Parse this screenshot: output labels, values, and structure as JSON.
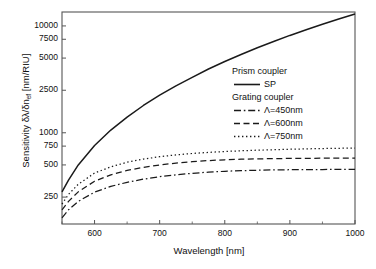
{
  "chart_data": {
    "type": "line",
    "title": "",
    "xlabel": "Wavelength [nm]",
    "ylabel_text": "Sensitivity δλ/δn",
    "ylabel_sub": "ef",
    "ylabel_unit": " [nm/RIU]",
    "yscale": "log",
    "xscale": "linear",
    "xlim": [
      550,
      1000
    ],
    "ylim": [
      140,
      13500
    ],
    "grid": false,
    "legend_position": "center-right",
    "xticks": [
      600,
      700,
      800,
      900,
      1000
    ],
    "xtick_labels": [
      "600",
      "700",
      "800",
      "900",
      "1000"
    ],
    "yticks": [
      250,
      500,
      750,
      1000,
      2500,
      5000,
      7500,
      10000
    ],
    "ytick_labels": [
      "250",
      "500",
      "750",
      "1000",
      "2500",
      "5000",
      "7500",
      "10000"
    ],
    "legend_groups": [
      {
        "heading": "Prism coupler",
        "entries": [
          {
            "label": "SP",
            "style": "solid"
          }
        ]
      },
      {
        "heading": "Grating coupler",
        "entries": [
          {
            "label": "Λ=450nm",
            "style": "dashdot"
          },
          {
            "label": "Λ=600nm",
            "style": "dashed"
          },
          {
            "label": "Λ=750nm",
            "style": "dotted"
          }
        ]
      }
    ],
    "series": [
      {
        "name": "SP",
        "group": "Prism coupler",
        "style": "solid",
        "x": [
          550,
          560,
          575,
          600,
          625,
          650,
          675,
          700,
          725,
          750,
          775,
          800,
          825,
          850,
          875,
          900,
          925,
          950,
          975,
          1000
        ],
        "y": [
          280,
          360,
          500,
          760,
          1060,
          1400,
          1800,
          2250,
          2750,
          3300,
          3950,
          4650,
          5400,
          6250,
          7150,
          8150,
          9200,
          10350,
          11600,
          12950
        ]
      },
      {
        "name": "Λ=750nm",
        "group": "Grating coupler",
        "style": "dotted",
        "x": [
          550,
          560,
          575,
          600,
          625,
          650,
          675,
          700,
          725,
          750,
          775,
          800,
          825,
          850,
          875,
          900,
          925,
          950,
          975,
          1000
        ],
        "y": [
          215,
          265,
          330,
          420,
          480,
          530,
          567,
          597,
          621,
          640,
          655,
          668,
          678,
          687,
          694,
          701,
          707,
          712,
          716,
          720
        ]
      },
      {
        "name": "Λ=600nm",
        "group": "Grating coupler",
        "style": "dashed",
        "x": [
          550,
          560,
          575,
          600,
          625,
          650,
          675,
          700,
          725,
          750,
          775,
          800,
          825,
          850,
          875,
          900,
          925,
          950,
          975,
          1000
        ],
        "y": [
          190,
          228,
          280,
          352,
          404,
          444,
          475,
          500,
          520,
          536,
          549,
          559,
          566,
          570,
          573,
          575,
          577,
          578,
          579,
          580
        ]
      },
      {
        "name": "Λ=450nm",
        "group": "Grating coupler",
        "style": "dashdot",
        "x": [
          550,
          560,
          575,
          600,
          625,
          650,
          675,
          700,
          725,
          750,
          775,
          800,
          825,
          850,
          875,
          900,
          925,
          950,
          975,
          1000
        ],
        "y": [
          160,
          190,
          228,
          278,
          315,
          344,
          368,
          388,
          404,
          417,
          428,
          436,
          442,
          446,
          449,
          451,
          452,
          453,
          454,
          455
        ]
      }
    ]
  },
  "colors": {
    "line": "#1a1a1a",
    "frame": "#555555",
    "background": "#ffffff"
  }
}
